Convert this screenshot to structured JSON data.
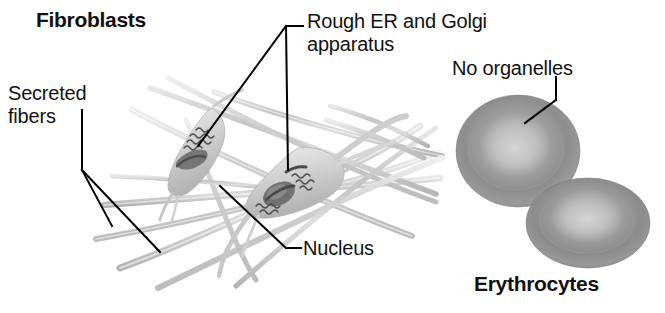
{
  "figure": {
    "title_left": "Fibroblasts",
    "title_right": "Erythrocytes",
    "background_color": "#ffffff",
    "text_color": "#111111"
  },
  "labels": {
    "fibroblasts": "Fibroblasts",
    "secreted_fibers": "Secreted\nfibers",
    "rough_er_golgi": "Rough ER and Golgi\napparatus",
    "nucleus": "Nucleus",
    "no_organelles": "No organelles",
    "erythrocytes": "Erythrocytes"
  },
  "colors": {
    "fiber_light": "#d8d8d8",
    "fiber_mid": "#bdbdbd",
    "cell_body": "#cfcfcf",
    "nucleus_dark": "#585858",
    "organelle_dark": "#4a4a4a",
    "rbc_rim": "#8a8a8a",
    "rbc_mid": "#a8a8a8",
    "rbc_center": "#cccccc",
    "leader_line": "#000000"
  },
  "diagram_parts": {
    "fibroblast_cells": 2,
    "erythrocyte_cells": 2,
    "fiber_strands": 9,
    "leader_lines": 6
  }
}
